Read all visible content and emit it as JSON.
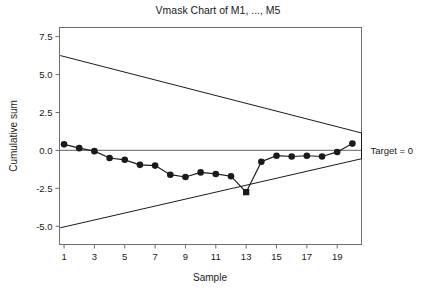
{
  "chart_data": {
    "type": "line",
    "title": "Vmask Chart of M1, ..., M5",
    "xlabel": "Sample",
    "ylabel": "Cumulative sum",
    "x": [
      1,
      2,
      3,
      4,
      5,
      6,
      7,
      8,
      9,
      10,
      11,
      12,
      13,
      14,
      15,
      16,
      17,
      18,
      19,
      20
    ],
    "values": [
      0.4,
      0.15,
      -0.05,
      -0.5,
      -0.62,
      -0.95,
      -1.0,
      -1.6,
      -1.75,
      -1.45,
      -1.55,
      -1.7,
      -2.75,
      -0.75,
      -0.35,
      -0.4,
      -0.35,
      -0.4,
      -0.1,
      0.45
    ],
    "xtick_labels": [
      "1",
      "3",
      "5",
      "7",
      "9",
      "11",
      "13",
      "15",
      "17",
      "19"
    ],
    "xticks": [
      1,
      3,
      5,
      7,
      9,
      11,
      13,
      15,
      17,
      19
    ],
    "ytick_labels": [
      "7.5",
      "5.0",
      "2.5",
      "0.0",
      "-2.5",
      "-5.0"
    ],
    "yticks": [
      7.5,
      5.0,
      2.5,
      0.0,
      -2.5,
      -5.0
    ],
    "xlim": [
      0.7,
      20.6
    ],
    "ylim": [
      -6.2,
      8.1
    ],
    "grid": false,
    "legend": false,
    "center_line": 0.0,
    "annotations": [
      {
        "name": "target-label",
        "text": "Target = 0",
        "y": 0.0
      }
    ],
    "vmask": {
      "vertex_x": 20.6,
      "vertex_upper_y": 1.15,
      "vertex_lower_y": -0.55,
      "upper_start": {
        "x": 0.75,
        "y": 6.25
      },
      "lower_start": {
        "x": 0.75,
        "y": -5.1
      }
    },
    "series_style": {
      "line_color": "#1a1a1a",
      "marker_color": "#1a1a1a",
      "marker_size": 3.3,
      "ooc_marker_color": "#1a1a1a"
    },
    "out_of_control_points": [
      13
    ],
    "center_line_color": "#808080",
    "frame_color": "#6e6e6e",
    "mask_color": "#1a1a1a"
  }
}
